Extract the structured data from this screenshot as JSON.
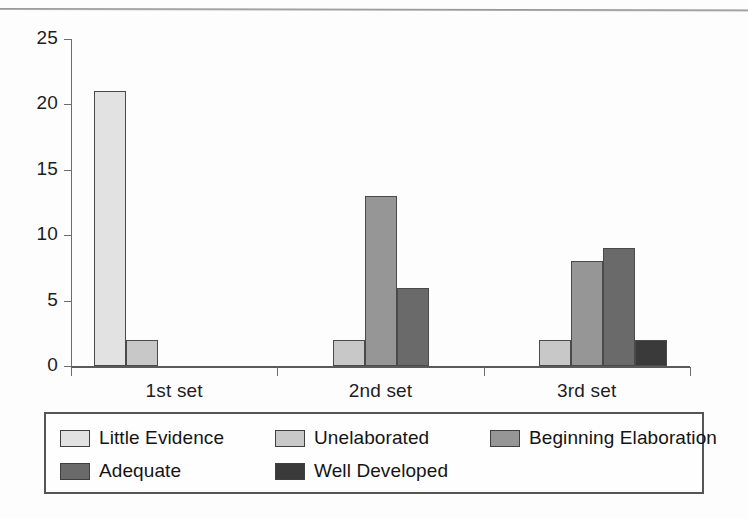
{
  "figure": {
    "background": "#fdfdfd",
    "frame_color": "#8e8e8e"
  },
  "chart_data": {
    "type": "bar",
    "title": "",
    "subtitle": "",
    "xlabel": "",
    "ylabel": "",
    "categories": [
      "1st set",
      "2nd set",
      "3rd set"
    ],
    "series": [
      {
        "name": "Little Evidence",
        "color": "#e2e2e2",
        "values": [
          21,
          0,
          0
        ]
      },
      {
        "name": "Unelaborated",
        "color": "#c8c8c8",
        "values": [
          2,
          2,
          2
        ]
      },
      {
        "name": "Beginning Elaboration",
        "color": "#969696",
        "values": [
          0,
          13,
          8
        ]
      },
      {
        "name": "Adequate",
        "color": "#6a6a6a",
        "values": [
          0,
          6,
          9
        ]
      },
      {
        "name": "Well Developed",
        "color": "#3a3a3a",
        "values": [
          0,
          0,
          2
        ]
      }
    ],
    "ylim": [
      0,
      25
    ],
    "yticks": [
      0,
      5,
      10,
      15,
      20,
      25
    ],
    "ytick_labels": [
      "0",
      "5",
      "10",
      "15",
      "20",
      "25"
    ],
    "grid": false,
    "legend_position": "bottom",
    "bar_edge_color": "#4a4a4a",
    "axis_color": "#5a5a5a"
  },
  "legend": {
    "entries": [
      {
        "label": "Little Evidence",
        "color": "#e2e2e2"
      },
      {
        "label": "Unelaborated",
        "color": "#c8c8c8"
      },
      {
        "label": "Beginning Elaboration",
        "color": "#969696"
      },
      {
        "label": "Adequate",
        "color": "#6a6a6a"
      },
      {
        "label": "Well Developed",
        "color": "#3a3a3a"
      }
    ]
  }
}
